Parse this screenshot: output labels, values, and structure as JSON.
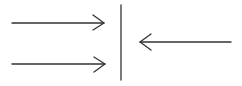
{
  "diagram": {
    "stroke_color": "#333333",
    "background": "#ffffff",
    "elements": [
      {
        "type": "arrow",
        "direction": "right",
        "from": [
          12,
          23
        ],
        "to": [
          104,
          23
        ]
      },
      {
        "type": "arrow",
        "direction": "right",
        "from": [
          12,
          64
        ],
        "to": [
          105,
          64
        ]
      },
      {
        "type": "line",
        "orientation": "vertical",
        "from": [
          121,
          5
        ],
        "to": [
          121,
          80
        ]
      },
      {
        "type": "arrow",
        "direction": "left",
        "from": [
          231,
          43
        ],
        "to": [
          140,
          43
        ]
      }
    ]
  }
}
